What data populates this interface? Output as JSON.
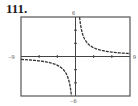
{
  "exercise": {
    "number": "111."
  },
  "window": {
    "xmin_label": "−9",
    "xmax_label": "9",
    "ymin_label": "−6",
    "ymax_label": "6"
  },
  "chart_data": {
    "type": "line",
    "title": "",
    "xlabel": "",
    "ylabel": "",
    "xlim": [
      -9,
      9
    ],
    "ylim": [
      -6,
      6
    ],
    "xscale_ticks": [
      -6,
      -3,
      3,
      6
    ],
    "yscale_ticks": [
      -4,
      -2,
      2,
      4
    ],
    "grid": false,
    "legend": null,
    "series": [
      {
        "name": "right-branch",
        "style": "dashed",
        "x": [
          0.67,
          1,
          1.5,
          2,
          3,
          4,
          5,
          6,
          7,
          8,
          9
        ],
        "y": [
          6.0,
          4.0,
          2.67,
          2.0,
          1.33,
          1.0,
          0.8,
          0.67,
          0.57,
          0.5,
          0.44
        ]
      },
      {
        "name": "left-branch",
        "style": "dashed",
        "x": [
          -9,
          -8,
          -7,
          -6,
          -5,
          -4,
          -3,
          -2,
          -1.5,
          -1,
          -0.67
        ],
        "y": [
          -0.44,
          -0.5,
          -0.57,
          -0.67,
          -0.8,
          -1.0,
          -1.33,
          -2.0,
          -2.67,
          -4.0,
          -6.0
        ]
      }
    ]
  }
}
